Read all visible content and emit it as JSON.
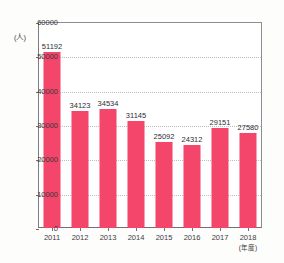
{
  "chart_data": {
    "type": "bar",
    "title": "",
    "xlabel": "(年度)",
    "ylabel": "(人)",
    "categories": [
      "2011",
      "2012",
      "2013",
      "2014",
      "2015",
      "2016",
      "2017",
      "2018"
    ],
    "values": [
      51192,
      34123,
      34534,
      31145,
      25092,
      24312,
      29151,
      27580
    ],
    "value_labels": [
      "51192",
      "34123",
      "34534",
      "31145",
      "25092",
      "24312",
      "29151",
      "27580"
    ],
    "ylim": [
      0,
      60000
    ],
    "yticks": [
      0,
      10000,
      20000,
      30000,
      40000,
      50000,
      60000
    ],
    "ytick_labels": [
      "0",
      "10000",
      "20000",
      "30000",
      "40000",
      "50000",
      "60000"
    ],
    "grid": true,
    "legend": null,
    "bar_color": "#f4456a",
    "grid_color": "#bdbdc2",
    "axis_color": "#6f6f75"
  },
  "figure": {
    "title_sliver": "",
    "background": "#fdfdfc"
  }
}
